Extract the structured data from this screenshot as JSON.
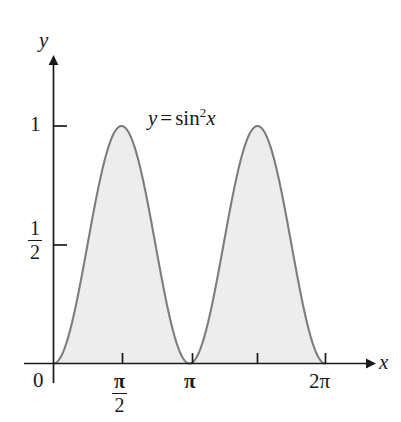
{
  "figure": {
    "name": "graph-of-y-equals-sin-squared-x",
    "background_color": "#ffffff"
  },
  "chart_data": {
    "type": "area",
    "title": "",
    "subtitle": "",
    "xlabel": "x",
    "ylabel": "y",
    "function": "y = sin^2 x",
    "equation_display": {
      "lhs": "y",
      "operator": "=",
      "function_name": "sin",
      "exponent": "2",
      "argument": "x"
    },
    "xlim": [
      0,
      7.0686
    ],
    "ylim": [
      0,
      1.18
    ],
    "grid": false,
    "legend": null,
    "shaded_region": {
      "fill_color": "#ededed",
      "from_x": 0,
      "to_x": 6.2832,
      "description": "region under curve from 0 to 2pi"
    },
    "curve": {
      "stroke_color": "#7d7d7d",
      "stroke_width": 2.1,
      "sampled_x": [
        0,
        0.1963,
        0.3927,
        0.589,
        0.7854,
        0.9817,
        1.1781,
        1.3744,
        1.5708,
        1.7671,
        1.9635,
        2.1598,
        2.3562,
        2.5525,
        2.7489,
        2.9452,
        3.1416,
        3.3379,
        3.5343,
        3.7306,
        3.927,
        4.1233,
        4.3197,
        4.516,
        4.7124,
        4.9087,
        5.1051,
        5.3014,
        5.4978,
        5.6941,
        5.8905,
        6.0868,
        6.2832
      ],
      "sampled_y": [
        0,
        0.0381,
        0.1464,
        0.3087,
        0.5,
        0.6913,
        0.8536,
        0.9619,
        1,
        0.9619,
        0.8536,
        0.6913,
        0.5,
        0.3087,
        0.1464,
        0.0381,
        0,
        0.0381,
        0.1464,
        0.3087,
        0.5,
        0.6913,
        0.8536,
        0.9619,
        1,
        0.9619,
        0.8536,
        0.6913,
        0.5,
        0.3087,
        0.1464,
        0.0381,
        0
      ]
    },
    "maxima": [
      {
        "x": 1.5708,
        "y": 1,
        "x_label": "pi/2"
      },
      {
        "x": 4.7124,
        "y": 1,
        "x_label": "3pi/2"
      }
    ],
    "minima": [
      {
        "x": 0,
        "y": 0,
        "x_label": "0"
      },
      {
        "x": 3.1416,
        "y": 0,
        "x_label": "pi"
      },
      {
        "x": 6.2832,
        "y": 0,
        "x_label": "2pi"
      }
    ],
    "x_ticks": [
      {
        "value": 0,
        "label": "0",
        "labeled": true
      },
      {
        "value": 1.5708,
        "label": "π/2",
        "labeled": true,
        "numerator": "π",
        "denominator": "2"
      },
      {
        "value": 3.1416,
        "label": "π",
        "labeled": true
      },
      {
        "value": 4.7124,
        "label": "",
        "labeled": false
      },
      {
        "value": 6.2832,
        "label": "2π",
        "labeled": true
      }
    ],
    "y_ticks": [
      {
        "value": 0.5,
        "label": "1/2",
        "labeled": true,
        "numerator": "1",
        "denominator": "2"
      },
      {
        "value": 1,
        "label": "1",
        "labeled": true
      }
    ],
    "axes": {
      "x_axis_arrow": true,
      "y_axis_arrow": true,
      "axis_color": "#1a1a1a",
      "axis_width": 1.6
    }
  },
  "labels": {
    "y_axis": "y",
    "x_axis": "x",
    "origin": "0",
    "ytick_one": "1",
    "ytick_half_numerator": "1",
    "ytick_half_denominator": "2",
    "xtick_halfpi_numerator": "π",
    "xtick_halfpi_denominator": "2",
    "xtick_pi": "π",
    "xtick_twopi": "2π",
    "equation_lhs": "y",
    "equation_operator": "=",
    "equation_fn": "sin",
    "equation_exponent": "2",
    "equation_arg": "x"
  },
  "colors": {
    "fill": "#ededed",
    "curve": "#7d7d7d",
    "axis": "#1a1a1a",
    "text": "#1a1a1a",
    "background": "#ffffff"
  }
}
